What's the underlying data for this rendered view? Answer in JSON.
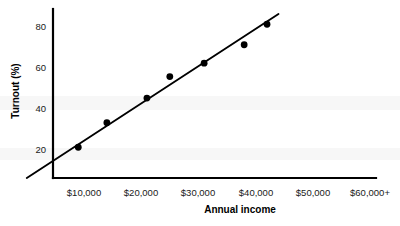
{
  "chart_data": {
    "type": "scatter",
    "title": "",
    "xlabel": "Annual income",
    "ylabel": "Turnout (%)",
    "x_tick_labels": [
      "$10,000",
      "$20,000",
      "$30,000",
      "$40,000",
      "$50,000",
      "$60,000+"
    ],
    "x_tick_values": [
      10000,
      20000,
      30000,
      40000,
      50000,
      60000
    ],
    "y_tick_labels": [
      "20",
      "40",
      "60",
      "80"
    ],
    "y_tick_values": [
      20,
      40,
      60,
      80
    ],
    "xlim": [
      0,
      65000
    ],
    "ylim": [
      0,
      88
    ],
    "grid": false,
    "legend": "none",
    "series": [
      {
        "name": "Voter turnout by income",
        "marker": "filled-circle",
        "color": "#000000",
        "points": [
          {
            "x": 9000,
            "y": 15
          },
          {
            "x": 14000,
            "y": 27
          },
          {
            "x": 21000,
            "y": 39
          },
          {
            "x": 25000,
            "y": 49.5
          },
          {
            "x": 31000,
            "y": 56
          },
          {
            "x": 38000,
            "y": 65
          },
          {
            "x": 42000,
            "y": 75
          }
        ]
      }
    ],
    "trend_line": {
      "name": "fit-line",
      "color": "#000000",
      "start": {
        "x": 0,
        "y": 0
      },
      "end": {
        "x": 44000,
        "y": 80
      }
    }
  },
  "axes": {
    "x_axis_name": "x-axis",
    "y_axis_name": "y-axis"
  }
}
